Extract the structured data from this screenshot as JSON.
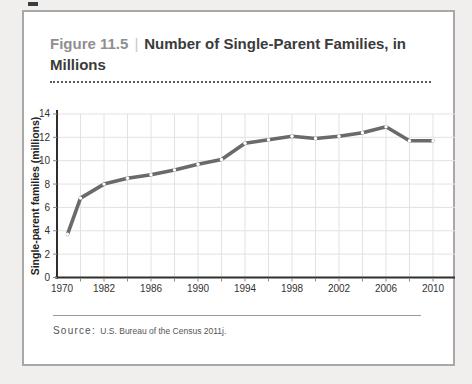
{
  "figure": {
    "label": "Figure 11.5",
    "divider": "|",
    "title": "Number of Single-Parent Families, in Millions",
    "source_label": "Source:",
    "source_text": "U.S. Bureau of the Census 2011j."
  },
  "chart_data": {
    "type": "line",
    "title": "Number of Single-Parent Families, in Millions",
    "xlabel": "",
    "ylabel": "Single-parent families (millions)",
    "x": [
      1970,
      1980,
      1982,
      1984,
      1986,
      1988,
      1990,
      1992,
      1994,
      1996,
      1998,
      2000,
      2002,
      2004,
      2006,
      2008,
      2010
    ],
    "values": [
      3.7,
      6.8,
      8.0,
      8.5,
      8.8,
      9.2,
      9.7,
      10.1,
      11.5,
      11.8,
      12.1,
      11.9,
      12.1,
      12.4,
      12.9,
      11.7,
      11.7
    ],
    "x_tick_labels": [
      "1970",
      "1982",
      "1986",
      "1990",
      "1994",
      "1998",
      "2002",
      "2006",
      "2010"
    ],
    "y_ticks": [
      0,
      2,
      4,
      6,
      8,
      10,
      12,
      14
    ],
    "ylim": [
      0,
      14
    ],
    "grid": true,
    "legend": "none",
    "note": "x-axis is non-linear: first labeled interval spans 1970-1982, remaining labels every 4 years, gridlines every 2 years",
    "colors": {
      "line": "#6a6a6a",
      "marker_fill": "#ffffff",
      "grid": "#e2e2e2",
      "axis": "#2e2e2e",
      "tick": "#8a8a8a",
      "tick_label": "#333333"
    },
    "layout": {
      "plot": {
        "left": 57,
        "right": 455,
        "top": 114,
        "bottom": 277.5,
        "axis_top": 110
      },
      "unit_px": 11.68,
      "x_gridlines_px": [
        80.5,
        104,
        127.5,
        151,
        174.5,
        198,
        221.5,
        245,
        268.5,
        292,
        315.5,
        339,
        362.5,
        386,
        409.5,
        433
      ],
      "x_label_px": [
        62,
        104,
        151,
        198,
        245,
        292,
        339,
        386,
        433
      ],
      "point_x_px": [
        67.5,
        80.5,
        104,
        127.5,
        151,
        174.5,
        198,
        221.5,
        245,
        268.5,
        292,
        315.5,
        339,
        362.5,
        386,
        409.5,
        433
      ]
    }
  }
}
